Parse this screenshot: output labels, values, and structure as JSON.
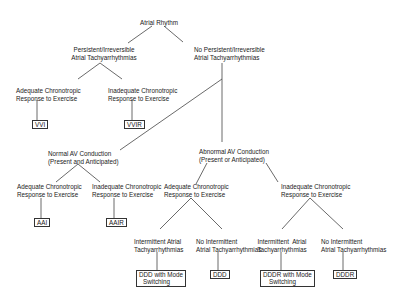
{
  "diagram": {
    "type": "decision-tree",
    "root": {
      "label": "Atrial Rhythm"
    },
    "level1": {
      "left": {
        "line1": "Persistent/Irreversible",
        "line2": "Atrial Tachyarrhythmias"
      },
      "right": {
        "line1": "No Persistent/Irreversible",
        "line2": "Atrial Tachyarrhythmias"
      }
    },
    "persistent_branch": {
      "adequate": {
        "line1": "Adequate Chronotropic",
        "line2": "Response to Exercise",
        "result": "VVI"
      },
      "inadequate": {
        "line1": "Inadequate Chronotropic",
        "line2": "Response to Exercise",
        "result": "VVIR"
      }
    },
    "normal_av": {
      "line1": "Normal AV Conduction",
      "line2": "(Present and Anticipated)",
      "adequate": {
        "line1": "Adequate Chronotropic",
        "line2": "Response to Exercise",
        "result": "AAI"
      },
      "inadequate": {
        "line1": "Inadequate Chronotropic",
        "line2": "Response to Exercise",
        "result": "AAIR"
      }
    },
    "abnormal_av": {
      "line1": "Abnormal AV Conduction",
      "line2": "(Present or Anticipated)",
      "adequate": {
        "line1": "Adequate Chronotropic",
        "line2": "Response to Exercise",
        "intermittent": {
          "line1": "Intermittent Atrial",
          "line2": "Tachyarrhythmias",
          "result_line1": "DDD with Mode",
          "result_line2": "Switching"
        },
        "no_intermittent": {
          "line1": "No Intermittent",
          "line2": "Atrial Tachyarrhythmias",
          "result": "DDD"
        }
      },
      "inadequate": {
        "line1": "Inadequate Chronotropic",
        "line2": "Response to Exercise",
        "intermittent": {
          "line1": "Intermittent  Atrial",
          "line2": "Tachyarrhythmias",
          "result_line1": "DDDR with Mode",
          "result_line2": "Switching"
        },
        "no_intermittent": {
          "line1": "No Intermittent",
          "line2": "Atrial Tachyarrhythmias",
          "result": "DDDR"
        }
      }
    },
    "colors": {
      "line": "#444444",
      "text": "#1a1a1a",
      "box_border": "#333333",
      "background": "#ffffff"
    }
  }
}
